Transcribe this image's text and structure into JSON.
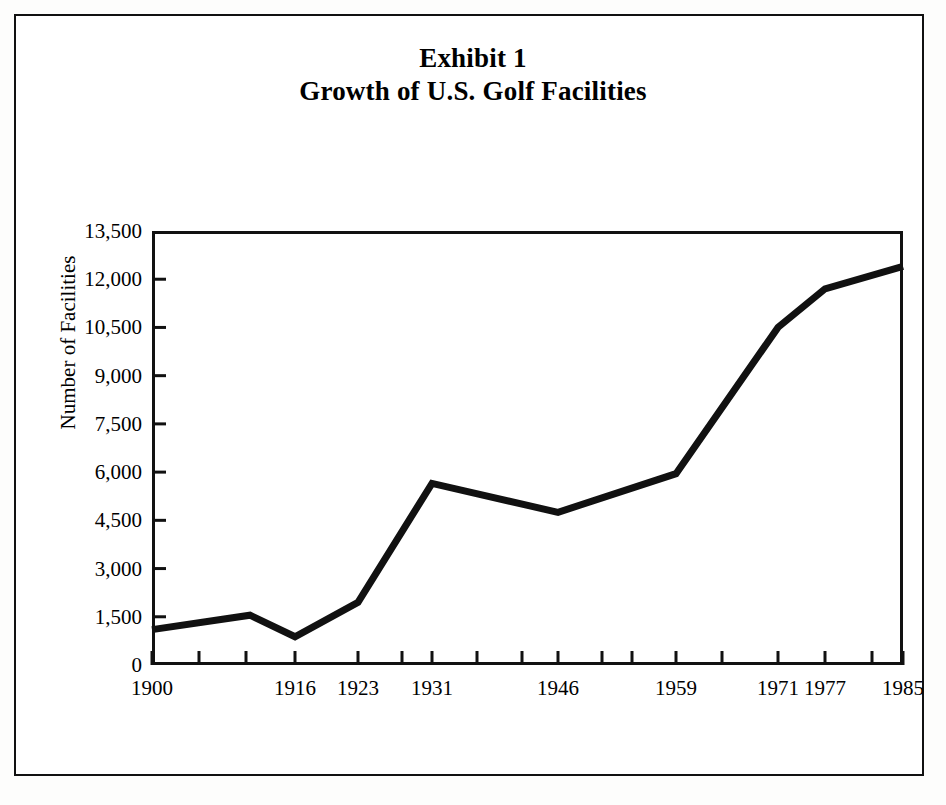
{
  "figure": {
    "title_line1": "Exhibit 1",
    "title_line2": "Growth of U.S. Golf Facilities"
  },
  "chart_data": {
    "type": "line",
    "xlabel": "",
    "ylabel": "Number of Facilities",
    "ylim": [
      0,
      13500
    ],
    "ytick_values": [
      0,
      1500,
      3000,
      4500,
      6000,
      7500,
      9000,
      10500,
      12000,
      13500
    ],
    "ytick_labels": [
      "0",
      "1,500",
      "3,000",
      "4,500",
      "6,000",
      "7,500",
      "9,000",
      "10,500",
      "12,000",
      "13,500"
    ],
    "xtick_labels": [
      "1900",
      "1916",
      "1923",
      "1931",
      "1946",
      "1959",
      "1971",
      "1977",
      "1985"
    ],
    "grid": false,
    "legend": null,
    "line_color": "#111111",
    "series": [
      {
        "name": "U.S. Golf Facilities",
        "x": [
          1900,
          1911,
          1916,
          1923,
          1931,
          1946,
          1959,
          1971,
          1977,
          1985
        ],
        "values": [
          1100,
          1550,
          880,
          1950,
          5650,
          4750,
          5950,
          10500,
          11700,
          12400
        ],
        "points_px": [
          {
            "x": 0,
            "y": 1100
          },
          {
            "x": 98,
            "y": 1550
          },
          {
            "x": 143,
            "y": 880
          },
          {
            "x": 206,
            "y": 1950
          },
          {
            "x": 280,
            "y": 5650
          },
          {
            "x": 406,
            "y": 4750
          },
          {
            "x": 524,
            "y": 5950
          },
          {
            "x": 626,
            "y": 10500
          },
          {
            "x": 673,
            "y": 11700
          },
          {
            "x": 751,
            "y": 12400
          }
        ]
      }
    ],
    "xtick_px": [
      0,
      47,
      94,
      143,
      206,
      250,
      280,
      325,
      370,
      406,
      450,
      480,
      524,
      570,
      626,
      673,
      720,
      751
    ],
    "xlabel_px": [
      0,
      143,
      206,
      280,
      406,
      524,
      626,
      673,
      751
    ]
  }
}
